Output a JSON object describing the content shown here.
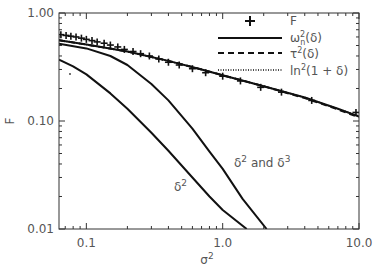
{
  "chart_data": {
    "type": "line",
    "title": "",
    "xlabel": "σ²",
    "ylabel": "F",
    "xscale": "log",
    "yscale": "log",
    "xlim": [
      0.063,
      10.0
    ],
    "ylim": [
      0.01,
      1.0
    ],
    "grid": false,
    "legend_position": "upper right",
    "x_ticks": [
      {
        "value": 0.1,
        "label": "0.1"
      },
      {
        "value": 1.0,
        "label": "1.0"
      },
      {
        "value": 10.0,
        "label": "10.0"
      }
    ],
    "y_ticks": [
      {
        "value": 0.01,
        "label": "0.01"
      },
      {
        "value": 0.1,
        "label": "0.10"
      },
      {
        "value": 1.0,
        "label": "1.00"
      }
    ],
    "series": [
      {
        "name": "F",
        "style": "plus-markers",
        "x": [
          0.065,
          0.071,
          0.077,
          0.084,
          0.092,
          0.1,
          0.11,
          0.12,
          0.135,
          0.15,
          0.17,
          0.19,
          0.22,
          0.25,
          0.29,
          0.34,
          0.4,
          0.48,
          0.6,
          0.75,
          1.0,
          1.35,
          1.9,
          2.7,
          4.5,
          9.5
        ],
        "values": [
          0.63,
          0.62,
          0.61,
          0.6,
          0.585,
          0.57,
          0.555,
          0.54,
          0.525,
          0.505,
          0.485,
          0.46,
          0.44,
          0.42,
          0.4,
          0.375,
          0.35,
          0.33,
          0.305,
          0.28,
          0.26,
          0.235,
          0.205,
          0.185,
          0.155,
          0.12
        ]
      },
      {
        "name": "ω²ₙ(δ)",
        "legend_label": "ω²n(δ)",
        "style": "solid",
        "x": [
          0.063,
          0.1,
          0.2,
          0.4,
          0.7,
          1.0,
          2.0,
          4.0,
          7.0,
          10.0
        ],
        "values": [
          0.56,
          0.51,
          0.44,
          0.36,
          0.3,
          0.265,
          0.21,
          0.165,
          0.13,
          0.11
        ]
      },
      {
        "name": "τ²(δ)",
        "style": "dashed",
        "x": [
          0.063,
          0.1,
          0.2,
          0.4,
          0.7,
          1.0,
          2.0,
          4.0,
          7.0,
          10.0
        ],
        "values": [
          0.56,
          0.51,
          0.44,
          0.36,
          0.3,
          0.265,
          0.21,
          0.163,
          0.128,
          0.108
        ]
      },
      {
        "name": "ln²(1 + δ)",
        "style": "dotted",
        "x": [
          0.063,
          0.1,
          0.2,
          0.4,
          0.7,
          1.0,
          2.0,
          4.0,
          7.0,
          10.0
        ],
        "values": [
          0.56,
          0.51,
          0.44,
          0.36,
          0.3,
          0.265,
          0.21,
          0.165,
          0.13,
          0.111
        ]
      },
      {
        "name": "δ² and δ³",
        "style": "solid",
        "x": [
          0.063,
          0.1,
          0.15,
          0.2,
          0.3,
          0.4,
          0.6,
          0.8,
          1.0,
          1.4,
          2.1
        ],
        "values": [
          0.52,
          0.47,
          0.4,
          0.33,
          0.22,
          0.155,
          0.085,
          0.052,
          0.036,
          0.019,
          0.01
        ]
      },
      {
        "name": "δ²",
        "style": "solid",
        "x": [
          0.063,
          0.08,
          0.1,
          0.15,
          0.2,
          0.3,
          0.4,
          0.6,
          0.8,
          1.0,
          1.5
        ],
        "values": [
          0.37,
          0.32,
          0.27,
          0.18,
          0.13,
          0.078,
          0.053,
          0.03,
          0.02,
          0.015,
          0.01
        ]
      }
    ],
    "annotations": [
      {
        "text": "δ²",
        "x": 0.42,
        "y": 0.042
      },
      {
        "text": "δ² and δ³",
        "x": 1.3,
        "y": 0.06
      }
    ]
  },
  "legend": {
    "items": [
      {
        "label_main": "F",
        "sup": "",
        "sub": "",
        "rest": "",
        "style": "plus"
      },
      {
        "label_main": "ω",
        "sup": "2",
        "sub": "n",
        "rest": "(δ)",
        "style": "solid"
      },
      {
        "label_main": "τ",
        "sup": "2",
        "sub": "",
        "rest": "(δ)",
        "style": "dashed"
      },
      {
        "label_main": "ln",
        "sup": "2",
        "sub": "",
        "rest": "(1 + δ)",
        "style": "dotted"
      }
    ]
  },
  "labels": {
    "xlabel_main": "σ",
    "xlabel_sup": "2",
    "ylabel": "F",
    "annot1_main": "δ",
    "annot1_sup": "2",
    "annot2_a": "δ",
    "annot2_a_sup": "2",
    "annot2_mid": " and ",
    "annot2_b": "δ",
    "annot2_b_sup": "3"
  },
  "colors": {
    "line": "#111111",
    "axis": "#333333",
    "text": "#555555",
    "background": "#ffffff"
  }
}
